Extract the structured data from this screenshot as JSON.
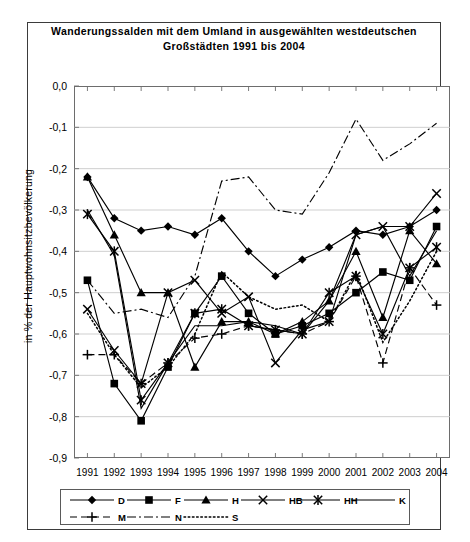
{
  "title": {
    "line1": "Wanderungssalden mit dem Umland in ausgewählten westdeutschen",
    "line2": "Großstädten 1991 bis 2004"
  },
  "axis": {
    "ylabel": "in % der Hauptwohnsitzbevölkerung"
  },
  "chart_data": {
    "type": "line",
    "title": "Wanderungssalden mit dem Umland in ausgewählten westdeutschen Großstädten 1991 bis 2004",
    "xlabel": "",
    "ylabel": "in % der Hauptwohnsitzbevölkerung",
    "ylim": [
      -0.9,
      0.0
    ],
    "yticks": [
      "0,0",
      "-0,1",
      "-0,2",
      "-0,3",
      "-0,4",
      "-0,5",
      "-0,6",
      "-0,7",
      "-0,8",
      "-0,9"
    ],
    "ytick_values": [
      0.0,
      -0.1,
      -0.2,
      -0.3,
      -0.4,
      -0.5,
      -0.6,
      -0.7,
      -0.8,
      -0.9
    ],
    "grid": true,
    "legend_position": "bottom",
    "categories": [
      "1991",
      "1992",
      "1993",
      "1994",
      "1995",
      "1996",
      "1997",
      "1998",
      "1999",
      "2000",
      "2001",
      "2002",
      "2003",
      "2004"
    ],
    "series": [
      {
        "name": "D",
        "marker": "diamond",
        "line": "solid",
        "values": [
          -0.22,
          -0.32,
          -0.35,
          -0.34,
          -0.36,
          -0.32,
          -0.4,
          -0.46,
          -0.42,
          -0.39,
          -0.35,
          -0.36,
          -0.34,
          -0.3
        ]
      },
      {
        "name": "F",
        "marker": "square",
        "line": "solid",
        "values": [
          -0.47,
          -0.72,
          -0.81,
          -0.68,
          -0.55,
          -0.46,
          -0.55,
          -0.6,
          -0.58,
          -0.55,
          -0.5,
          -0.45,
          -0.47,
          -0.34
        ]
      },
      {
        "name": "H",
        "marker": "triangle",
        "line": "solid",
        "values": [
          -0.22,
          -0.36,
          -0.5,
          -0.5,
          -0.68,
          -0.57,
          -0.57,
          -0.6,
          -0.57,
          -0.52,
          -0.4,
          -0.56,
          -0.35,
          -0.43
        ]
      },
      {
        "name": "HB",
        "marker": "x",
        "line": "solid",
        "values": [
          -0.54,
          -0.64,
          -0.72,
          -0.5,
          -0.47,
          -0.55,
          -0.51,
          -0.67,
          -0.59,
          -0.57,
          -0.36,
          -0.34,
          -0.34,
          -0.26
        ]
      },
      {
        "name": "HH",
        "marker": "asterisk",
        "line": "solid",
        "values": [
          -0.31,
          -0.4,
          -0.76,
          -0.67,
          -0.55,
          -0.54,
          -0.58,
          -0.59,
          -0.6,
          -0.5,
          -0.46,
          -0.6,
          -0.44,
          -0.39
        ]
      },
      {
        "name": "K",
        "marker": "none",
        "line": "solid",
        "values": [
          -0.3,
          -0.41,
          -0.78,
          -0.67,
          -0.58,
          -0.58,
          -0.57,
          -0.58,
          -0.6,
          -0.52,
          -0.36,
          -0.34,
          -0.46,
          -0.35
        ]
      },
      {
        "name": "M",
        "marker": "plus",
        "line": "dashed",
        "values": [
          -0.65,
          -0.65,
          -0.72,
          -0.67,
          -0.61,
          -0.6,
          -0.58,
          -0.59,
          -0.6,
          -0.57,
          -0.46,
          -0.67,
          -0.44,
          -0.53
        ]
      },
      {
        "name": "N",
        "marker": "none",
        "line": "dashdot",
        "values": [
          -0.47,
          -0.55,
          -0.54,
          -0.56,
          -0.46,
          -0.23,
          -0.22,
          -0.3,
          -0.31,
          -0.21,
          -0.08,
          -0.18,
          -0.14,
          -0.09
        ]
      },
      {
        "name": "S",
        "marker": "none",
        "line": "dotted",
        "values": [
          -0.55,
          -0.65,
          -0.73,
          -0.68,
          -0.6,
          -0.45,
          -0.51,
          -0.54,
          -0.53,
          -0.57,
          -0.45,
          -0.62,
          -0.52,
          -0.4
        ]
      }
    ]
  },
  "legend": {
    "items": [
      {
        "label": "D",
        "symbol": "diamond-line-symbol"
      },
      {
        "label": "F",
        "symbol": "square-line-symbol"
      },
      {
        "label": "H",
        "symbol": "triangle-line-symbol"
      },
      {
        "label": "HB",
        "symbol": "x-line-symbol"
      },
      {
        "label": "HH",
        "symbol": "asterisk-line-symbol"
      },
      {
        "label": "K",
        "symbol": "plain-line-symbol"
      },
      {
        "label": "M",
        "symbol": "dashed-plus-line-symbol"
      },
      {
        "label": "N",
        "symbol": "dashdot-line-symbol"
      },
      {
        "label": "S",
        "symbol": "dotted-line-symbol"
      }
    ]
  }
}
